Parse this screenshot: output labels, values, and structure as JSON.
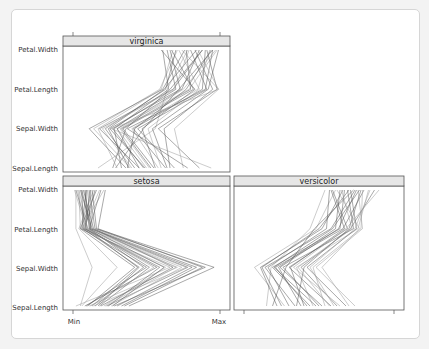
{
  "chart_data": {
    "type": "parallel-coordinates",
    "title": "",
    "layout": "lattice 2x2 (panels: virginica top-left; setosa bottom-left; versicolor bottom-right)",
    "variables": [
      "Sepal.Length",
      "Sepal.Width",
      "Petal.Length",
      "Petal.Width"
    ],
    "x_axis": {
      "ticks": [
        "Min",
        "Max"
      ],
      "range": [
        0,
        1
      ]
    },
    "panels": [
      {
        "name": "virginica",
        "lines": [
          [
            0.17,
            0.56,
            0.64,
            0.78
          ],
          [
            0.38,
            0.24,
            0.62,
            0.84
          ],
          [
            0.29,
            0.48,
            0.72,
            0.95
          ],
          [
            0.5,
            0.3,
            0.79,
            0.98
          ],
          [
            0.45,
            0.18,
            0.68,
            0.88
          ],
          [
            0.63,
            0.41,
            0.88,
            0.9
          ],
          [
            0.39,
            0.14,
            0.59,
            0.71
          ],
          [
            0.66,
            0.62,
            0.95,
            0.83
          ],
          [
            0.55,
            0.34,
            0.82,
            0.67
          ],
          [
            0.75,
            0.69,
            0.99,
            0.74
          ],
          [
            0.33,
            0.28,
            0.65,
            0.61
          ],
          [
            0.42,
            0.22,
            0.63,
            0.7
          ],
          [
            0.58,
            0.4,
            0.85,
            0.93
          ],
          [
            0.48,
            0.27,
            0.7,
            0.64
          ],
          [
            0.36,
            0.11,
            0.61,
            0.76
          ],
          [
            0.52,
            0.32,
            0.75,
            0.97
          ],
          [
            0.69,
            0.44,
            0.91,
            0.8
          ],
          [
            0.27,
            0.36,
            0.66,
            0.88
          ],
          [
            0.6,
            0.51,
            0.86,
            0.72
          ],
          [
            0.86,
            0.58,
            0.98,
            0.91
          ],
          [
            0.45,
            0.3,
            0.74,
            0.86
          ],
          [
            0.4,
            0.2,
            0.69,
            0.79
          ],
          [
            0.56,
            0.47,
            0.83,
            0.6
          ],
          [
            0.78,
            0.37,
            0.9,
            0.95
          ],
          [
            0.3,
            0.17,
            0.6,
            0.68
          ],
          [
            0.64,
            0.54,
            0.92,
            0.99
          ],
          [
            0.49,
            0.25,
            0.73,
            0.66
          ],
          [
            0.94,
            0.26,
            0.99,
            0.85
          ],
          [
            0.37,
            0.42,
            0.77,
            0.94
          ],
          [
            0.53,
            0.33,
            0.8,
            0.77
          ]
        ]
      },
      {
        "name": "setosa",
        "lines": [
          [
            0.02,
            0.66,
            0.05,
            0.04
          ],
          [
            0.13,
            0.44,
            0.09,
            0.09
          ],
          [
            0.23,
            0.78,
            0.12,
            0.06
          ],
          [
            0.06,
            0.3,
            0.04,
            0.14
          ],
          [
            0.18,
            0.52,
            0.1,
            0.02
          ],
          [
            0.28,
            0.9,
            0.15,
            0.11
          ],
          [
            0.11,
            0.71,
            0.07,
            0.18
          ],
          [
            0.33,
            0.84,
            0.13,
            0.05
          ],
          [
            0.08,
            0.57,
            0.08,
            0.12
          ],
          [
            0.21,
            0.63,
            0.06,
            0.21
          ],
          [
            0.15,
            0.48,
            0.11,
            0.08
          ],
          [
            0.38,
            0.96,
            0.16,
            0.13
          ],
          [
            0.26,
            0.74,
            0.09,
            0.03
          ],
          [
            0.1,
            0.42,
            0.05,
            0.16
          ],
          [
            0.19,
            0.68,
            0.14,
            0.07
          ],
          [
            0.05,
            0.13,
            0.02,
            0.02
          ],
          [
            0.3,
            0.81,
            0.12,
            0.1
          ],
          [
            0.24,
            0.59,
            0.08,
            0.15
          ],
          [
            0.14,
            0.77,
            0.1,
            0.04
          ],
          [
            0.35,
            0.88,
            0.17,
            0.22
          ],
          [
            0.09,
            0.5,
            0.06,
            0.09
          ],
          [
            0.22,
            0.7,
            0.13,
            0.12
          ],
          [
            0.17,
            0.45,
            0.07,
            0.06
          ],
          [
            0.27,
            0.62,
            0.11,
            0.19
          ],
          [
            0.12,
            0.55,
            0.09,
            0.01
          ]
        ]
      },
      {
        "name": "versicolor",
        "lines": [
          [
            0.27,
            0.07,
            0.48,
            0.61
          ],
          [
            0.42,
            0.21,
            0.66,
            0.8
          ],
          [
            0.62,
            0.38,
            0.71,
            0.87
          ],
          [
            0.15,
            0.18,
            0.44,
            0.54
          ],
          [
            0.5,
            0.26,
            0.73,
            0.69
          ],
          [
            0.34,
            0.14,
            0.58,
            0.74
          ],
          [
            0.74,
            0.48,
            0.79,
            0.76
          ],
          [
            0.58,
            0.3,
            0.69,
            0.59
          ],
          [
            0.22,
            0.11,
            0.52,
            0.66
          ],
          [
            0.46,
            0.35,
            0.76,
            0.83
          ],
          [
            0.68,
            0.42,
            0.75,
            0.71
          ],
          [
            0.38,
            0.23,
            0.61,
            0.64
          ],
          [
            0.54,
            0.46,
            0.78,
            0.79
          ],
          [
            0.3,
            0.16,
            0.55,
            0.57
          ],
          [
            0.19,
            0.28,
            0.47,
            0.73
          ],
          [
            0.64,
            0.33,
            0.68,
            0.9
          ],
          [
            0.44,
            0.19,
            0.64,
            0.67
          ],
          [
            0.35,
            0.4,
            0.7,
            0.78
          ],
          [
            0.7,
            0.52,
            0.77,
            0.62
          ],
          [
            0.52,
            0.24,
            0.63,
            0.75
          ],
          [
            0.25,
            0.12,
            0.5,
            0.7
          ],
          [
            0.6,
            0.44,
            0.74,
            0.84
          ],
          [
            0.4,
            0.31,
            0.67,
            0.58
          ],
          [
            0.48,
            0.2,
            0.59,
            0.77
          ],
          [
            0.57,
            0.36,
            0.72,
            0.65
          ]
        ]
      }
    ],
    "grid": false,
    "legend": null
  },
  "labels": {
    "y_axis": [
      "Sepal.Length",
      "Sepal.Width",
      "Petal.Length",
      "Petal.Width"
    ],
    "x_min": "Min",
    "x_max": "Max",
    "strips": {
      "virginica": "virginica",
      "setosa": "setosa",
      "versicolor": "versicolor"
    }
  },
  "colors": {
    "strip_fill": "#e6e6e6",
    "line": "#555555",
    "line_light": "#9a9a9a",
    "frame": "#555555"
  }
}
